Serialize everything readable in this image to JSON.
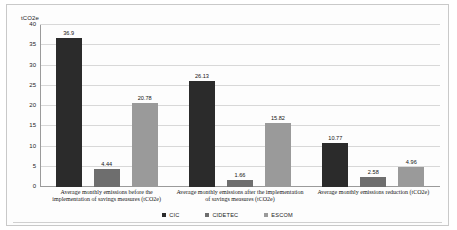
{
  "chart_data": {
    "type": "bar",
    "title": "",
    "xlabel": "",
    "ylabel": "tCO2e",
    "ylim": [
      0,
      40
    ],
    "ytick_step": 5,
    "yticks": [
      40,
      35,
      30,
      25,
      20,
      15,
      10,
      5,
      0
    ],
    "grid": true,
    "legend_position": "bottom",
    "categories": [
      "Average monthly emissions before the implementation of savings measures (tCO2e)",
      "Average monthly emissions after the implementation of savings measures (tCO2e)",
      "Average monthly emissions reduction (tCO2e)"
    ],
    "series": [
      {
        "name": "CIC",
        "color": "#2b2b2b",
        "values": [
          36.9,
          26.13,
          10.77
        ]
      },
      {
        "name": "CIDETEC",
        "color": "#6e6e6e",
        "values": [
          4.44,
          1.66,
          2.58
        ]
      },
      {
        "name": "ESCOM",
        "color": "#9a9a9a",
        "values": [
          20.78,
          15.82,
          4.96
        ]
      }
    ],
    "value_labels": [
      [
        "36.9",
        "4.44",
        "20.78"
      ],
      [
        "26.13",
        "1.66",
        "15.82"
      ],
      [
        "10.77",
        "2.58",
        "4.96"
      ]
    ]
  }
}
